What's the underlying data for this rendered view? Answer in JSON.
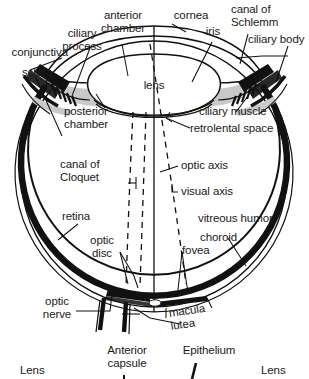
{
  "figure": {
    "type": "anatomical-diagram",
    "colors": {
      "background": "#ffffff",
      "outline": "#111111",
      "wall_dark": "#111111",
      "shading_gray": "#c9c9c9",
      "text": "#1a1a1a"
    }
  },
  "labels": {
    "conjunctiva": "conjunctiva",
    "sclera": "sclera",
    "ciliary_process": "ciliary\nprocess",
    "anterior_chamber": "anterior\nchamber",
    "cornea": "cornea",
    "iris": "iris",
    "canal_of_schlemm": "canal of\nSchlemm",
    "ciliary_body": "ciliary body",
    "lens": "lens",
    "posterior_chamber": "posterior\nchamber",
    "ciliary_muscle": "ciliary muscle",
    "retrolental_space": "retrolental space",
    "canal_of_cloquet": "canal of\nCloquet",
    "optic_axis": "optic axis",
    "visual_axis": "visual axis",
    "vitreous_humor": "vitreous humor",
    "retina": "retina",
    "choroid": "choroid",
    "optic_disc": "optic\ndisc",
    "fovea": "fovea",
    "optic_nerve": "optic\nnerve",
    "macula_lutea": "macula\nlutea"
  },
  "bottom_figure": {
    "lens_left": "Lens",
    "anterior_capsule": "Anterior\ncapsule",
    "epithelium": "Epithelium",
    "lens_right": "Lens"
  }
}
